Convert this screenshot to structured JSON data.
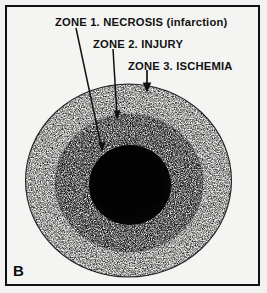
{
  "figure": {
    "panel_letter": "B",
    "background_color": "#f2f2f0",
    "frame_color": "#111111",
    "labels": [
      {
        "id": "zone-1",
        "prefix": "ZONE 1.",
        "term": "NECROSIS",
        "qualifier": "(infarction)",
        "text": "ZONE 1.  NECROSIS (infarction)"
      },
      {
        "id": "zone-2",
        "prefix": "ZONE 2.",
        "term": "INJURY",
        "qualifier": "",
        "text": "ZONE 2.  INJURY"
      },
      {
        "id": "zone-3",
        "prefix": "ZONE 3.",
        "term": "ISCHEMIA",
        "qualifier": "",
        "text": "ZONE 3.  ISCHEMIA"
      }
    ],
    "zones": [
      {
        "id": "necrosis-core",
        "label": "ZONE 1. NECROSIS (infarction)",
        "shade": "dark",
        "color": "#0a0a0a"
      },
      {
        "id": "injury-ring",
        "label": "ZONE 2. INJURY",
        "shade": "medium-stipple",
        "color": "#4a4a4a"
      },
      {
        "id": "ischemia-ring",
        "label": "ZONE 3. ISCHEMIA",
        "shade": "light-stipple",
        "color": "#9a9a9a"
      }
    ],
    "leaders": [
      {
        "id": "leader-zone-1",
        "points": "76,28 102,150",
        "target": "necrosis-core"
      },
      {
        "id": "leader-zone-2",
        "points": "113,49 117,118",
        "target": "injury-ring"
      },
      {
        "id": "leader-zone-3",
        "points": "147,72 147,92",
        "target": "ischemia-ring"
      }
    ]
  }
}
